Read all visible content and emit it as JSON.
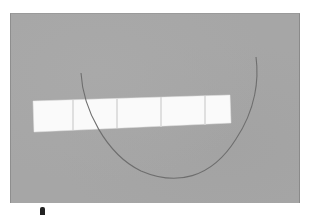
{
  "photo": {
    "subject": "white paper strip with curved thin fiber on gray background",
    "colors": {
      "background": "#a6a6a6",
      "strip": "#fafafa",
      "strip_divider": "#d8d8d8",
      "fiber": "#6e6e6e"
    },
    "strip_segments": 5
  }
}
